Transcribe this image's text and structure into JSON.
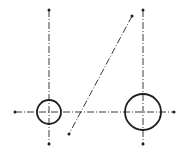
{
  "diagram": {
    "type": "technical-drawing",
    "colors": {
      "line": "#1e1e1e",
      "centerline": "#3a3a3a",
      "background": "#ffffff"
    },
    "horizontal_centerline": {
      "x1": 15,
      "y1": 112,
      "x2": 174,
      "y2": 112
    },
    "circles": [
      {
        "id": "small-circle",
        "cx": 49,
        "cy": 112,
        "r": 12
      },
      {
        "id": "large-circle",
        "cx": 143,
        "cy": 112,
        "r": 18
      }
    ],
    "vertical_centerlines": [
      {
        "id": "left-vertical",
        "x1": 49,
        "y1": 10,
        "x2": 49,
        "y2": 144
      },
      {
        "id": "right-vertical",
        "x1": 143,
        "y1": 10,
        "x2": 143,
        "y2": 144
      }
    ],
    "diagonal_line": {
      "x1": 132,
      "y1": 16,
      "x2": 69,
      "y2": 134
    }
  }
}
